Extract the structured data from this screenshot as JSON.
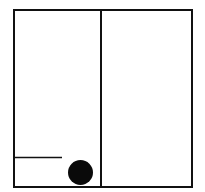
{
  "canvas": {
    "width": 205,
    "height": 192,
    "background": "#ffffff"
  },
  "colors": {
    "stroke": "#111111",
    "fill": "#0a0a0a"
  },
  "diagram": {
    "outer_box": {
      "x": 14,
      "y": 10,
      "width": 178,
      "height": 177,
      "stroke_width": 2
    },
    "divider": {
      "x": 101,
      "y1": 10,
      "y2": 187,
      "stroke_width": 2
    },
    "ledge": {
      "x1": 15,
      "x2": 62,
      "y": 157.5,
      "stroke_width": 1.3
    },
    "ball": {
      "cx": 80.5,
      "cy": 172.5,
      "r": 12.5
    }
  }
}
